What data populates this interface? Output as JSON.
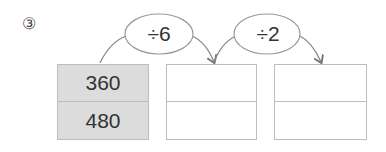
{
  "problem_number": "③",
  "operations": [
    {
      "label": "÷6"
    },
    {
      "label": "÷2"
    }
  ],
  "tables": [
    {
      "values": [
        "360",
        "480"
      ],
      "shaded": true
    },
    {
      "values": [
        "",
        ""
      ],
      "shaded": false
    },
    {
      "values": [
        "",
        ""
      ],
      "shaded": false
    }
  ],
  "colors": {
    "shade": "#dcdcdc",
    "line": "#888888",
    "border": "#bdbdbd"
  }
}
